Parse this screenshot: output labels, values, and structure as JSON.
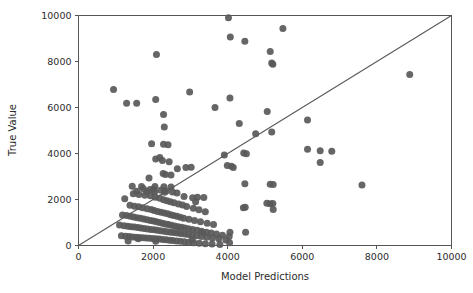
{
  "chart_data": {
    "type": "scatter",
    "title": "",
    "xlabel": "Model Predictions",
    "ylabel": "True Value",
    "xlim": [
      0,
      10000
    ],
    "ylim": [
      0,
      10000
    ],
    "xticks": [
      0,
      2000,
      4000,
      6000,
      8000,
      10000
    ],
    "yticks": [
      0,
      2000,
      4000,
      6000,
      8000,
      10000
    ],
    "xtick_labels": [
      "0",
      "2000",
      "4000",
      "6000",
      "8000",
      "10000"
    ],
    "ytick_labels": [
      "0",
      "2000",
      "4000",
      "6000",
      "8000",
      "10000"
    ],
    "grid": false,
    "legend": null,
    "marker_color": "#595959",
    "marker_size": 5.2,
    "reference_line": {
      "name": "identity-line",
      "description": "y = x diagonal",
      "from": [
        0,
        0
      ],
      "to": [
        10000,
        10000
      ],
      "color": "#595959"
    },
    "series": [
      {
        "name": "predictions-vs-true",
        "x": [
          4020,
          5480,
          4070,
          4460,
          5140,
          5180,
          5210,
          2090,
          8880,
          940,
          1290,
          1560,
          2070,
          2980,
          4060,
          3660,
          5060,
          2280,
          4310,
          6140,
          4750,
          5180,
          2300,
          1960,
          2280,
          2400,
          3910,
          4430,
          4500,
          2180,
          2070,
          6480,
          6790,
          6140,
          2250,
          2430,
          3990,
          4100,
          4150,
          2650,
          2880,
          6480,
          3020,
          2270,
          2330,
          2480,
          1890,
          1440,
          1690,
          2050,
          2290,
          2480,
          1240,
          4460,
          5140,
          5220,
          7600,
          2020,
          1560,
          1830,
          2040,
          2310,
          2640,
          3190,
          3360,
          5050,
          5210,
          1740,
          1920,
          2210,
          2350,
          2520,
          2830,
          3060,
          3140,
          4470,
          5130,
          5220,
          1470,
          1620,
          1780,
          1930,
          2060,
          2180,
          2280,
          2370,
          2460,
          2560,
          2680,
          2790,
          2900,
          3080,
          3230,
          3400,
          1380,
          1500,
          1610,
          1720,
          1840,
          1950,
          2030,
          2120,
          2210,
          2300,
          2390,
          2470,
          2550,
          2640,
          2730,
          2820,
          2960,
          3110,
          3270,
          3450,
          3620,
          1180,
          1290,
          1390,
          1480,
          1570,
          1660,
          1750,
          1840,
          1930,
          2010,
          2090,
          2170,
          2250,
          2330,
          2410,
          2490,
          2580,
          2670,
          2760,
          2850,
          2950,
          3060,
          3180,
          3300,
          3430,
          3560,
          3700,
          3860,
          4040,
          1100,
          1220,
          1320,
          1410,
          1500,
          1590,
          1670,
          1760,
          1850,
          1940,
          2030,
          2110,
          2200,
          2290,
          2380,
          2470,
          2560,
          2650,
          2740,
          2840,
          2940,
          3050,
          3170,
          3300,
          3440,
          3590,
          3760,
          3950,
          4060,
          1150,
          1260,
          1360,
          1450,
          1540,
          1630,
          1720,
          1810,
          1900,
          1990,
          2080,
          2170,
          2260,
          2350,
          2440,
          2530,
          2630,
          2730,
          2840,
          2960,
          3090,
          3240,
          3400,
          3580,
          3790,
          4050,
          4480,
          3050,
          3330,
          2070,
          1600,
          1330,
          4420
        ],
        "y": [
          9900,
          9440,
          9060,
          8880,
          8440,
          7940,
          7880,
          8300,
          7440,
          6780,
          6180,
          6190,
          6350,
          6670,
          6410,
          6000,
          5830,
          5700,
          5300,
          5460,
          4860,
          4940,
          5150,
          4420,
          4400,
          4380,
          3930,
          4020,
          3990,
          3830,
          3760,
          4120,
          4100,
          4180,
          3700,
          3640,
          3480,
          3450,
          3390,
          3340,
          3390,
          3610,
          3400,
          3130,
          3090,
          3060,
          2940,
          2580,
          2570,
          2560,
          2550,
          2540,
          2030,
          2680,
          2660,
          2650,
          2630,
          2450,
          2360,
          2340,
          2330,
          2320,
          2280,
          2100,
          2090,
          1840,
          1830,
          2470,
          2440,
          2400,
          2370,
          2330,
          2130,
          2080,
          1900,
          1660,
          1820,
          1560,
          2250,
          2220,
          2190,
          2160,
          2100,
          2050,
          1990,
          1950,
          1900,
          1860,
          1800,
          1760,
          1700,
          1620,
          1550,
          1470,
          1750,
          1710,
          1680,
          1640,
          1600,
          1560,
          1520,
          1480,
          1450,
          1410,
          1380,
          1340,
          1300,
          1270,
          1230,
          1190,
          1140,
          1090,
          1030,
          970,
          910,
          1330,
          1300,
          1270,
          1240,
          1210,
          1180,
          1150,
          1120,
          1090,
          1060,
          1030,
          1000,
          970,
          940,
          910,
          880,
          850,
          820,
          790,
          760,
          730,
          700,
          660,
          620,
          580,
          540,
          500,
          450,
          390,
          890,
          860,
          840,
          820,
          800,
          780,
          760,
          740,
          720,
          700,
          680,
          660,
          640,
          620,
          600,
          580,
          560,
          540,
          520,
          500,
          480,
          450,
          420,
          390,
          360,
          330,
          290,
          240,
          580,
          420,
          400,
          390,
          370,
          360,
          350,
          340,
          330,
          320,
          300,
          290,
          280,
          260,
          250,
          230,
          220,
          200,
          180,
          160,
          140,
          120,
          100,
          80,
          60,
          40,
          120,
          580,
          250,
          560,
          180,
          290,
          200,
          1640
        ]
      }
    ]
  }
}
